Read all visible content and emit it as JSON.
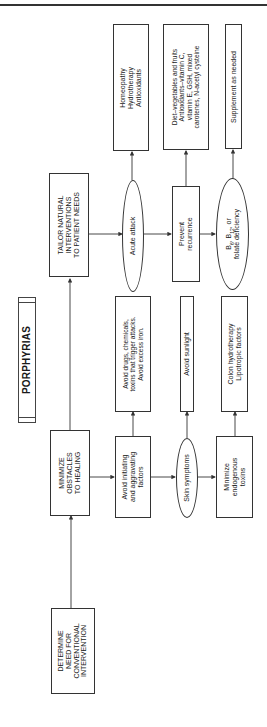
{
  "header": {
    "rule": true
  },
  "title": "PORPHYRIAS",
  "nodes": {
    "determine": "DETERMINE\nNEED FOR\nCONVENTIONAL\nINTERVENTION",
    "minimize": "MINIMIZE\nOBSTACLES\nTO HEALING",
    "tailor": "TAILOR NATURAL\nINTERVENTIONS\nTO PATIENT NEEDS",
    "avoid_initiating": "Avoid initiating\nand aggravating\nfactors",
    "skin_symptoms": "Skin symptoms",
    "minimize_toxins": "Minimize\nendogenous\ntoxins",
    "avoid_drugs": "Avoid drugs, chemicals,\ntoxins that trigger attacks.\nAvoid excess iron.",
    "avoid_sunlight": "Avoid sunlight",
    "colon": "Colon hydrotherapy\nLipotropic factors",
    "acute_attack": "Acute attack",
    "prevent_recurrence": "Prevent\nrecurrence",
    "b_deficiency": {
      "b6": "B",
      "b6_sub": "6",
      "b12": "B",
      "b12_sub": "12",
      "line1_tail": ", or",
      "line2": "folate deficiency"
    },
    "homeopathy": "Homeopathy\nHydrotherapy\nAntioxidants",
    "diet": "Diet–vegetables and fruits\nAntioxidants–vitamin C,\nvitamin E, GSH, mixed\ncarotenes, N-acetyl cysteine",
    "supplement": "Supplement as needed"
  },
  "edges": [
    [
      "determine",
      "minimize"
    ],
    [
      "minimize",
      "tailor"
    ],
    [
      "minimize",
      "avoid_initiating"
    ],
    [
      "avoid_initiating",
      "skin_symptoms"
    ],
    [
      "skin_symptoms",
      "minimize_toxins"
    ],
    [
      "avoid_initiating",
      "avoid_drugs"
    ],
    [
      "skin_symptoms",
      "avoid_sunlight"
    ],
    [
      "minimize_toxins",
      "colon"
    ],
    [
      "tailor",
      "acute_attack"
    ],
    [
      "acute_attack",
      "prevent_recurrence"
    ],
    [
      "prevent_recurrence",
      "b_deficiency"
    ],
    [
      "acute_attack",
      "homeopathy"
    ],
    [
      "prevent_recurrence",
      "diet"
    ],
    [
      "b_deficiency",
      "supplement"
    ]
  ],
  "colors": {
    "line": "#333333",
    "background": "#ffffff"
  }
}
